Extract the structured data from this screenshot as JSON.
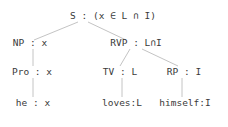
{
  "tree": {
    "root": {
      "label": "S : (x ∈ L ∩ I)",
      "x": 113,
      "y": 10
    },
    "np": {
      "label": "NP : x",
      "x": 30,
      "y": 37
    },
    "vp": {
      "label": "RVP : L∩I",
      "x": 136,
      "y": 37
    },
    "pro": {
      "label": "Pro : x",
      "x": 32,
      "y": 66
    },
    "he": {
      "label": "he : x",
      "x": 33,
      "y": 97
    },
    "tv": {
      "label": "TV : L",
      "x": 120,
      "y": 66
    },
    "rp": {
      "label": "RP : I",
      "x": 184,
      "y": 66
    },
    "loves": {
      "label": "loves:L",
      "x": 122,
      "y": 97
    },
    "himself": {
      "label": "himself:I",
      "x": 185,
      "y": 97
    }
  },
  "style": {
    "line_color": "#b8b8b8",
    "text_color": "#3a3a3a"
  }
}
